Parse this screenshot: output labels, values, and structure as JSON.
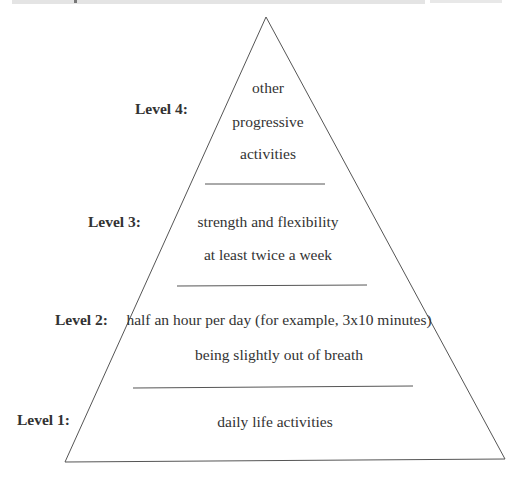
{
  "diagram": {
    "type": "pyramid",
    "levels": [
      {
        "id": 4,
        "label": "Level 4:",
        "lines": [
          "other",
          "progressive",
          "activities"
        ]
      },
      {
        "id": 3,
        "label": "Level 3:",
        "lines": [
          "strength and flexibility",
          "at least twice a week"
        ]
      },
      {
        "id": 2,
        "label": "Level 2:",
        "lines": [
          "half an hour per day (for example, 3x10 minutes)",
          "being slightly out of breath"
        ]
      },
      {
        "id": 1,
        "label": "Level 1:",
        "lines": [
          "daily life activities"
        ]
      }
    ],
    "colors": {
      "stroke": "#555555",
      "text": "#333333",
      "background": "#ffffff"
    }
  }
}
